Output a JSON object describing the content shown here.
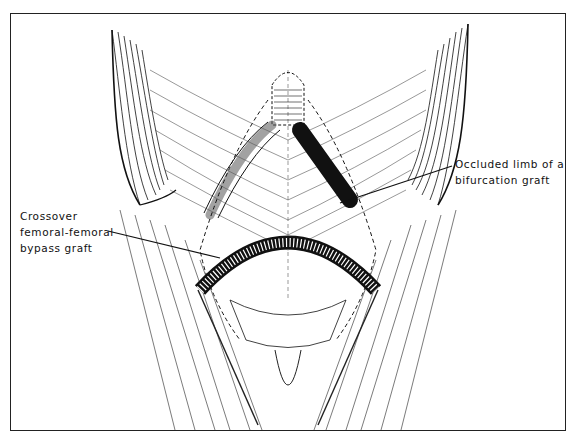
{
  "figure": {
    "type": "surgical illustration",
    "colors": {
      "ink": "#111111",
      "background": "#ffffff",
      "border": "#222222"
    }
  },
  "annotations": [
    {
      "id": "occluded-limb",
      "lines": [
        "Occluded limb of a",
        "bifurcation graft"
      ],
      "target": "left limb of aortic bifurcation graft (shaded dark)"
    },
    {
      "id": "crossover-graft",
      "lines": [
        "Crossover",
        "femoral-femoral",
        "bypass graft"
      ],
      "target": "curved ringed graft crossing suprapubic region"
    }
  ]
}
